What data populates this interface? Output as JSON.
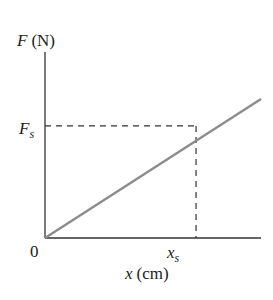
{
  "chart_data": {
    "type": "line",
    "title": "",
    "xlabel_var": "x",
    "xlabel_unit": "(cm)",
    "ylabel_var": "F",
    "ylabel_unit": "(N)",
    "origin_label": "0",
    "x_tick_label": {
      "main": "x",
      "sub": "s"
    },
    "y_tick_label": {
      "main": "F",
      "sub": "s"
    },
    "xlim": [
      0,
      1.43
    ],
    "ylim": [
      0,
      1.66
    ],
    "series": [
      {
        "name": "F vs x",
        "x": [
          0,
          1.43
        ],
        "y": [
          0,
          1.24
        ],
        "color": "#8c8c8c"
      }
    ],
    "marked_point": {
      "x": 1,
      "y": 1,
      "x_label": "x_s",
      "y_label": "F_s"
    },
    "grid": false,
    "legend": "none"
  },
  "colors": {
    "axis": "#333333",
    "line": "#8c8c8c",
    "dash": "#333333"
  }
}
